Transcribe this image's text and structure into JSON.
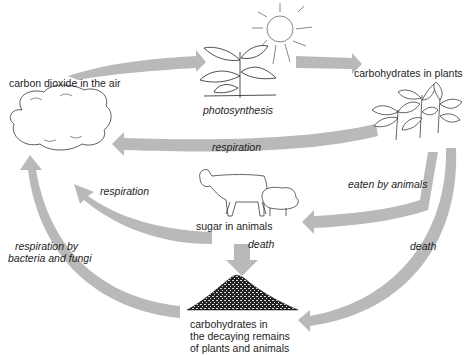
{
  "colors": {
    "arrow": "#b9b9b9",
    "line": "#2a2a2a",
    "text": "#1e1e1e",
    "background": "#ffffff"
  },
  "nodes": {
    "co2": "carbon dioxide in the air",
    "plants": "carbohydrates in plants",
    "animals": "sugar in animals",
    "decay_line1": "carbohydrates in",
    "decay_line2": "the decaying remains",
    "decay_line3": "of plants and animals"
  },
  "processes": {
    "photosynthesis": "photosynthesis",
    "respiration_plants": "respiration",
    "respiration_animals": "respiration",
    "eaten": "eaten by animals",
    "death_animals": "death",
    "death_plants": "death",
    "decomposers_line1": "respiration by",
    "decomposers_line2": "bacteria and fungi"
  },
  "icons": [
    "cloud-icon",
    "sun-icon",
    "seedling-icon",
    "plants-icon",
    "cow-icon",
    "sheep-icon",
    "decay-heap-icon"
  ]
}
